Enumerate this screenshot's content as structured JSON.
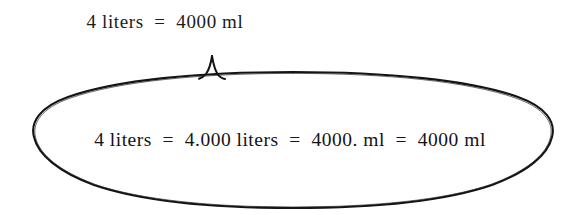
{
  "figure": {
    "background_color": "#ffffff",
    "ink_color": "#141414",
    "callout": {
      "label": "4 liters  =  4000 ml"
    },
    "ellipse": {
      "shape": "ellipse",
      "stroke_color": "#141414",
      "equation": "4 liters  =  4.000 liters  =  4000. ml  =  4000 ml"
    },
    "pointer": {
      "shape": "spike-pointer"
    }
  }
}
